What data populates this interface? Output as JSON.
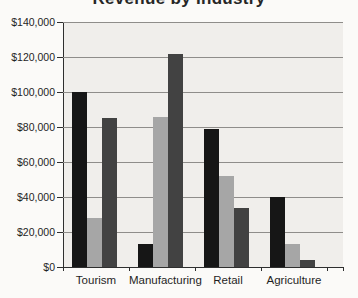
{
  "title": "Revenue by Industry",
  "colors": {
    "background": "#fbfaf8",
    "plot_background": "#f0eeeb",
    "gridline": "#8f8d8a",
    "axis": "#2e2e2e",
    "text": "#1f1f1f"
  },
  "chart_data": {
    "type": "bar",
    "title": "Revenue by Industry",
    "categories": [
      "Tourism",
      "Manufacturing",
      "Retail",
      "Agriculture"
    ],
    "series": [
      {
        "name": "black",
        "color": "#161616",
        "values": [
          100000,
          13000,
          79000,
          40000
        ]
      },
      {
        "name": "light-gray",
        "color": "#a6a6a6",
        "values": [
          28000,
          86000,
          52000,
          13000
        ]
      },
      {
        "name": "dark-gray",
        "color": "#424242",
        "values": [
          85000,
          122000,
          34000,
          4000
        ]
      }
    ],
    "xlabel": "",
    "ylabel": "",
    "ylim": [
      0,
      140000
    ],
    "ytick_step": 20000,
    "ytick_labels": [
      "$0",
      "$20,000",
      "$40,000",
      "$60,000",
      "$80,000",
      "$100,000",
      "$120,000",
      "$140,000"
    ],
    "grid": true,
    "legend_position": "none",
    "currency_format": "$#,##0"
  }
}
